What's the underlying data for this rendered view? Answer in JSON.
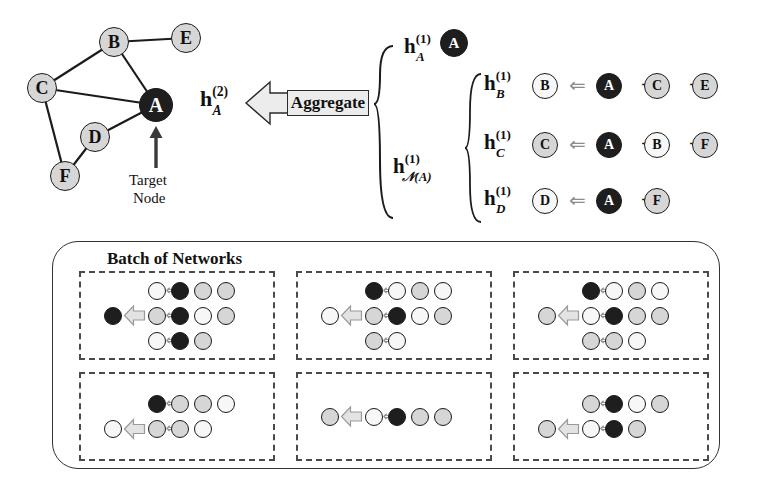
{
  "figure": {
    "title_text": "Batch of Networks",
    "target_label_line1": "Target",
    "target_label_line2": "Node",
    "aggregate_label": "Aggregate",
    "plus_symbol": "+",
    "implies_arrow": "⇐",
    "colors": {
      "dark_node": "#1e1e1e",
      "light_node": "#d6d6d6",
      "white_node": "#f7f7f7",
      "mid_node": "#b9b9b9",
      "outline": "#1b1b1b",
      "arrow_gray": "#8c8c8c",
      "aggregate_fill": "#ececec",
      "dashed_border": "#4a4a4a",
      "frame": "#333333",
      "background": "#ffffff"
    }
  },
  "graph": {
    "nodes": [
      {
        "id": "A",
        "label": "A",
        "shade": "dark",
        "x": 156,
        "y": 105,
        "r": 17
      },
      {
        "id": "B",
        "label": "B",
        "shade": "light",
        "x": 114,
        "y": 42,
        "r": 15
      },
      {
        "id": "C",
        "label": "C",
        "shade": "light",
        "x": 42,
        "y": 88,
        "r": 15
      },
      {
        "id": "D",
        "label": "D",
        "shade": "light",
        "x": 95,
        "y": 137,
        "r": 15
      },
      {
        "id": "E",
        "label": "E",
        "shade": "light",
        "x": 186,
        "y": 38,
        "r": 15
      },
      {
        "id": "F",
        "label": "F",
        "shade": "light",
        "x": 65,
        "y": 176,
        "r": 15
      }
    ],
    "edges": [
      {
        "from": "B",
        "to": "E"
      },
      {
        "from": "B",
        "to": "C"
      },
      {
        "from": "B",
        "to": "A"
      },
      {
        "from": "C",
        "to": "A"
      },
      {
        "from": "C",
        "to": "F"
      },
      {
        "from": "D",
        "to": "A"
      },
      {
        "from": "D",
        "to": "F"
      }
    ],
    "target_pointer": {
      "x": 156,
      "y_tail": 168,
      "y_head": 130
    }
  },
  "output_embedding": {
    "base": "h",
    "superscript": "(2)",
    "subscript": "A",
    "x": 200,
    "y": 86
  },
  "self_embedding": {
    "base": "h",
    "superscript": "(1)",
    "subscript": "A",
    "x": 404,
    "y": 33,
    "node": {
      "label": "A",
      "shade": "dark",
      "x": 454,
      "y": 43,
      "r": 14
    }
  },
  "neighborhood_embedding": {
    "base": "h",
    "superscript": "(1)",
    "subscript": "𝒩(A)",
    "x": 393,
    "y": 153
  },
  "equations": [
    {
      "lhs_base": "h",
      "lhs_sup": "(1)",
      "lhs_sub": "B",
      "target": {
        "label": "B",
        "shade": "white"
      },
      "terms": [
        {
          "label": "A",
          "shade": "dark"
        },
        {
          "label": "C",
          "shade": "light"
        },
        {
          "label": "E",
          "shade": "light"
        }
      ]
    },
    {
      "lhs_base": "h",
      "lhs_sup": "(1)",
      "lhs_sub": "C",
      "target": {
        "label": "C",
        "shade": "light"
      },
      "terms": [
        {
          "label": "A",
          "shade": "dark"
        },
        {
          "label": "B",
          "shade": "white"
        },
        {
          "label": "F",
          "shade": "light"
        }
      ]
    },
    {
      "lhs_base": "h",
      "lhs_sup": "(1)",
      "lhs_sub": "D",
      "target": {
        "label": "D",
        "shade": "white"
      },
      "terms": [
        {
          "label": "A",
          "shade": "dark"
        },
        {
          "label": "F",
          "shade": "light"
        }
      ]
    }
  ],
  "batch": {
    "title": "Batch of Networks",
    "cells": [
      {
        "id": "cell-1",
        "rows": [
          {
            "out": null,
            "chain": [
              "white",
              "dark",
              "light",
              "light"
            ]
          },
          {
            "out": "dark",
            "chain": [
              "light",
              "dark",
              "white",
              "light"
            ]
          },
          {
            "out": null,
            "chain": [
              "white",
              "dark",
              "light"
            ]
          }
        ]
      },
      {
        "id": "cell-2",
        "rows": [
          {
            "out": null,
            "chain": [
              "dark",
              "white",
              "light",
              "white"
            ]
          },
          {
            "out": "white",
            "chain": [
              "light",
              "dark",
              "white",
              "light"
            ]
          },
          {
            "out": null,
            "chain": [
              "light",
              "white"
            ]
          }
        ]
      },
      {
        "id": "cell-3",
        "rows": [
          {
            "out": null,
            "chain": [
              "dark",
              "white",
              "light",
              "white"
            ]
          },
          {
            "out": "light",
            "chain": [
              "white",
              "dark",
              "light",
              "light"
            ]
          },
          {
            "out": null,
            "chain": [
              "light",
              "light",
              "white"
            ]
          }
        ]
      },
      {
        "id": "cell-4",
        "rows": [
          {
            "out": null,
            "chain": [
              "dark",
              "light",
              "light",
              "white"
            ]
          },
          {
            "out": "white",
            "chain": [
              "light",
              "light",
              "white"
            ]
          }
        ]
      },
      {
        "id": "cell-5",
        "rows": [
          {
            "out": "light",
            "chain": [
              "white",
              "dark",
              "light",
              "light"
            ]
          }
        ]
      },
      {
        "id": "cell-6",
        "rows": [
          {
            "out": null,
            "chain": [
              "light",
              "dark",
              "white",
              "light"
            ]
          },
          {
            "out": "light",
            "chain": [
              "white",
              "dark",
              "light"
            ]
          }
        ]
      }
    ]
  }
}
